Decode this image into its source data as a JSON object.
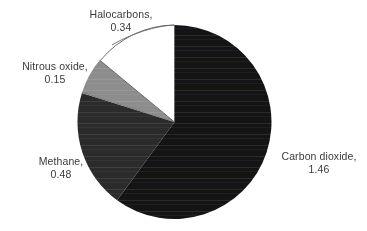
{
  "chart_data": {
    "type": "pie",
    "title": "",
    "subtitle": "",
    "xlabel": "",
    "ylabel": "",
    "legend_position": "none",
    "grid": false,
    "total": 2.43,
    "units": "",
    "start_angle_deg": 0,
    "direction": "clockwise",
    "categories": [
      "Carbon dioxide",
      "Methane",
      "Nitrous oxide",
      "Halocarbons"
    ],
    "values": [
      1.46,
      0.48,
      0.15,
      0.34
    ],
    "colors": [
      "#141414",
      "#2b2b2b",
      "#8d8d8d",
      "#ffffff"
    ],
    "slices": [
      {
        "name": "Carbon dioxide",
        "value": 1.46,
        "value_text": "1.46",
        "label_line1": "Carbon dioxide,",
        "label_line2": "1.46",
        "color": "#141414",
        "start_deg": 0,
        "end_deg": 216.3
      },
      {
        "name": "Methane",
        "value": 0.48,
        "value_text": "0.48",
        "label_line1": "Methane,",
        "label_line2": "0.48",
        "color": "#2b2b2b",
        "start_deg": 216.3,
        "end_deg": 287.4
      },
      {
        "name": "Nitrous oxide",
        "value": 0.15,
        "value_text": "0.15",
        "label_line1": "Nitrous oxide,",
        "label_line2": "0.15",
        "color": "#8d8d8d",
        "start_deg": 287.4,
        "end_deg": 309.6
      },
      {
        "name": "Halocarbons",
        "value": 0.34,
        "value_text": "0.34",
        "label_line1": "Halocarbons,",
        "label_line2": "0.34",
        "color": "#ffffff",
        "start_deg": 309.6,
        "end_deg": 360
      }
    ]
  },
  "labels": {
    "halocarbons": {
      "line1": "Halocarbons,",
      "line2": "0.34"
    },
    "nitrous_oxide": {
      "line1": "Nitrous oxide,",
      "line2": "0.15"
    },
    "methane": {
      "line1": "Methane,",
      "line2": "0.48"
    },
    "carbon_dioxide": {
      "line1": "Carbon dioxide,",
      "line2": "1.46"
    }
  },
  "style": {
    "background": "#ffffff",
    "text_color": "#3a3a3a",
    "outline_color": "#555555"
  }
}
